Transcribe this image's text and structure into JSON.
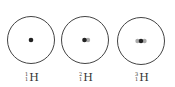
{
  "diagram": {
    "atoms": [
      {
        "mass": "1",
        "atomic": "1",
        "symbol": "H",
        "name": "protium",
        "nucleons": 1
      },
      {
        "mass": "2",
        "atomic": "1",
        "symbol": "H",
        "name": "deuterium",
        "nucleons": 2
      },
      {
        "mass": "3",
        "atomic": "1",
        "symbol": "H",
        "name": "tritium",
        "nucleons": 3
      }
    ],
    "colors": {
      "orbit": "#444444",
      "nucleus": "#222222",
      "neutron": "#999999"
    }
  }
}
